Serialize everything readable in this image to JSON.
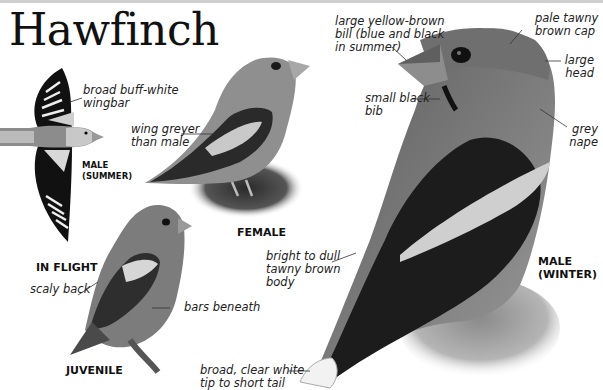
{
  "page": {
    "title": "Hawfinch"
  },
  "figures": {
    "in_flight": {
      "caption": "IN FLIGHT",
      "sub_caption_line1": "MALE",
      "sub_caption_line2": "(SUMMER)",
      "labels": [
        {
          "line1": "broad buff-white",
          "line2": "wingbar"
        }
      ]
    },
    "female": {
      "caption": "FEMALE",
      "labels": [
        {
          "line1": "wing greyer",
          "line2": "than male"
        }
      ]
    },
    "juvenile": {
      "caption": "JUVENILE",
      "labels": [
        {
          "line1": "scaly back"
        },
        {
          "line1": "bars beneath"
        }
      ]
    },
    "male_winter": {
      "caption_line1": "MALE",
      "caption_line2": "(WINTER)",
      "labels": [
        {
          "line1": "large yellow-brown",
          "line2": "bill (blue and black",
          "line3": "in summer)"
        },
        {
          "line1": "pale tawny",
          "line2": "brown cap"
        },
        {
          "line1": "large",
          "line2": "head"
        },
        {
          "line1": "small black",
          "line2": "bib"
        },
        {
          "line1": "grey",
          "line2": "nape"
        },
        {
          "line1": "bright to dull",
          "line2": "tawny brown",
          "line3": "body"
        },
        {
          "line1": "broad, clear white",
          "line2": "tip to short tail"
        }
      ]
    }
  }
}
